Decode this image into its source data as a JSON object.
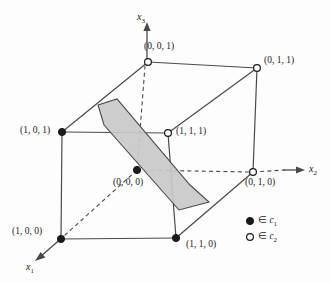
{
  "figure": {
    "background_color": "#fdfdfd",
    "line_color": "#4a4a4a",
    "plane_fill_color": "#c9c9c9",
    "plane_edge_color": "#4a4a4a",
    "marker_filled_color": "#1a1a1a",
    "marker_open_color": "#ffffff"
  },
  "axes": [
    {
      "name": "x1",
      "label": "x",
      "subscript": "1",
      "direction": "down-left",
      "style": "solid-arrow",
      "x": 28,
      "y": 262
    },
    {
      "name": "x2",
      "label": "x",
      "subscript": "2",
      "direction": "right",
      "style": "solid-arrow",
      "x": 308,
      "y": 168
    },
    {
      "name": "x3",
      "label": "x",
      "subscript": "3",
      "direction": "up",
      "style": "solid-arrow",
      "x": 140,
      "y": 14
    }
  ],
  "vertices": [
    {
      "name": "vertex-001",
      "label": "(0, 0, 1)",
      "marker": "open",
      "class": "c2",
      "cx": 148,
      "cy": 62,
      "lx": 144,
      "ly": 48
    },
    {
      "name": "vertex-011",
      "label": "(0, 1, 1)",
      "marker": "open",
      "class": "c2",
      "cx": 257,
      "cy": 68,
      "lx": 265,
      "ly": 62
    },
    {
      "name": "vertex-101",
      "label": "(1, 0, 1)",
      "marker": "filled",
      "class": "c1",
      "cx": 62,
      "cy": 132,
      "lx": 22,
      "ly": 126
    },
    {
      "name": "vertex-111",
      "label": "(1, 1, 1)",
      "marker": "open",
      "class": "c2",
      "cx": 168,
      "cy": 133,
      "lx": 177,
      "ly": 128
    },
    {
      "name": "vertex-000",
      "label": "(0, 0, 0)",
      "marker": "filled",
      "class": "c1",
      "cx": 137,
      "cy": 170,
      "lx": 116,
      "ly": 181
    },
    {
      "name": "vertex-010",
      "label": "(0, 1, 0)",
      "marker": "open",
      "class": "c2",
      "cx": 253,
      "cy": 172,
      "lx": 248,
      "ly": 181
    },
    {
      "name": "vertex-100",
      "label": "(1, 0, 0)",
      "marker": "filled",
      "class": "c1",
      "cx": 61,
      "cy": 239,
      "lx": 12,
      "ly": 226
    },
    {
      "name": "vertex-110",
      "label": "(1, 1, 0)",
      "marker": "filled",
      "class": "c1",
      "cx": 176,
      "cy": 238,
      "lx": 186,
      "ly": 244
    }
  ],
  "plane": {
    "name": "separating-hyperplane",
    "shape": "hexagon",
    "points": "98,105 117,99 190,185 209,202 179,210 104,125"
  },
  "legend": [
    {
      "name": "legend-class-1",
      "marker": "filled",
      "symbol": "∈",
      "label": "c",
      "subscript": "1",
      "x": 257,
      "y": 224
    },
    {
      "name": "legend-class-2",
      "marker": "open",
      "symbol": "∈",
      "label": "c",
      "subscript": "2",
      "x": 257,
      "y": 240
    }
  ],
  "chart_data": {
    "type": "scatter",
    "xlabel": "x1",
    "ylabel": "x2",
    "zlabel": "x3",
    "categories": [
      "(0, 0, 0)",
      "(0, 0, 1)",
      "(0, 1, 0)",
      "(0, 1, 1)",
      "(1, 0, 0)",
      "(1, 0, 1)",
      "(1, 1, 0)",
      "(1, 1, 1)"
    ],
    "series": [
      {
        "name": "c1",
        "marker": "filled",
        "points": [
          "(0, 0, 0)",
          "(1, 0, 0)",
          "(1, 0, 1)",
          "(1, 1, 0)"
        ]
      },
      {
        "name": "c2",
        "marker": "open",
        "points": [
          "(0, 0, 1)",
          "(0, 1, 0)",
          "(0, 1, 1)",
          "(1, 1, 1)"
        ]
      }
    ],
    "legend_position": "bottom-right",
    "grid": false,
    "xlim": [
      0,
      1
    ],
    "ylim": [
      0,
      1
    ],
    "zlim": [
      0,
      1
    ]
  }
}
